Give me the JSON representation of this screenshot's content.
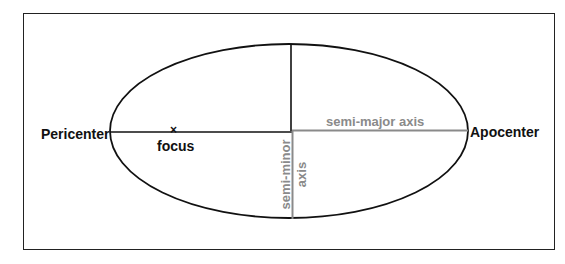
{
  "diagram": {
    "labels": {
      "pericenter": "Pericenter",
      "apocenter": "Apocenter",
      "focus": "focus",
      "focus_marker": "×",
      "semi_major": "semi-major axis",
      "semi_minor_line1": "semi-minor",
      "semi_minor_line2": "axis"
    },
    "colors": {
      "outline": "#111111",
      "axis_highlight": "#8a8a8a",
      "background": "#ffffff"
    },
    "ellipse": {
      "center": [
        292,
        131
      ],
      "rx": 179,
      "ry": 87
    }
  }
}
